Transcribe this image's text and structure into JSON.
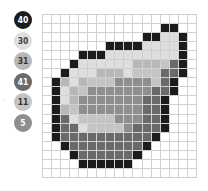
{
  "palette": [
    {
      "code": "40",
      "label": "40",
      "color": "#1c1c1c",
      "text": "#ffffff"
    },
    {
      "code": "30",
      "label": "30",
      "color": "#dedede",
      "text": "#444444"
    },
    {
      "code": "31",
      "label": "31",
      "color": "#b8b8b8",
      "text": "#333333"
    },
    {
      "code": "41",
      "label": "41",
      "color": "#6a6a6a",
      "text": "#ffffff"
    },
    {
      "code": "11",
      "label": "11",
      "color": "#c4c4c4",
      "text": "#333333"
    },
    {
      "code": "5",
      "label": "5",
      "color": "#8e8e8e",
      "text": "#ffffff"
    }
  ],
  "grid": {
    "columns": 17,
    "rows": 18,
    "key": {
      "K": "40",
      "L": "30",
      "S": "31",
      "D": "41",
      "E": "11",
      "M": "5",
      ".": ""
    },
    "cells": [
      ".................",
      ".............KK..",
      "...........KKLLK.",
      ".......KKKKLLLLK.",
      "....KKKLLLLLLLLK.",
      "...KLLLLLLSSSEDK.",
      "..KLLLSSSLEEEDDK.",
      ".KSLSEEEMMMMEDK..",
      ".KLSEMMMMMMMDDK..",
      ".KLSMMMMMMMDDK...",
      ".KSEMMMMMMMDDK...",
      ".KDLEEEEMMMDDK...",
      ".KDDLEEEEMDDDK...",
      ".KDDDDDDDDDDK....",
      "..KDDDDDDDDK.....",
      "...KDDDDDDK......",
      "....KKKKKK.......",
      "................."
    ]
  }
}
